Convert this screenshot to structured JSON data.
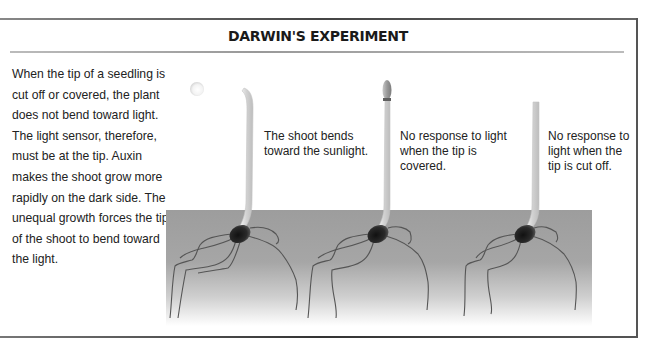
{
  "figure": {
    "title": "DARWIN'S EXPERIMENT",
    "intro_text": "When the tip of a seedling is cut off or covered, the plant does not bend toward light. The light sensor, therefore, must be at the tip. Auxin makes the shoot grow more rapidly on the dark side. The unequal growth forces the tip of the shoot to bend toward the light.",
    "panels": [
      {
        "id": "intact",
        "caption": "The shoot bends toward the sunlight.",
        "has_light_source": true
      },
      {
        "id": "covered",
        "caption": "No response to light when the tip is covered.",
        "has_tip_cover": true
      },
      {
        "id": "cut",
        "caption": "No response to light when the tip is cut off."
      }
    ],
    "colors": {
      "soil_top": "#9d9d9d",
      "stem": "#e0e0e0",
      "seed": "#1a1a1a",
      "root": "#555555",
      "frame": "#444444"
    }
  }
}
